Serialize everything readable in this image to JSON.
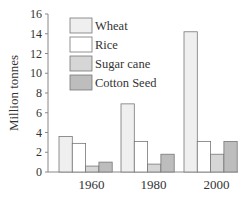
{
  "chart_data": {
    "type": "bar",
    "title": "",
    "xlabel": "",
    "ylabel": "Million tonnes",
    "ylim": [
      0,
      16
    ],
    "yticks": [
      0,
      2,
      4,
      6,
      8,
      10,
      12,
      14,
      16
    ],
    "grid": false,
    "legend_position": "upper-left (inside)",
    "categories": [
      "1960",
      "1980",
      "2000"
    ],
    "series": [
      {
        "name": "Wheat",
        "color": "#efefef",
        "values": [
          3.6,
          6.9,
          14.2
        ]
      },
      {
        "name": "Rice",
        "color": "#ffffff",
        "values": [
          2.9,
          3.1,
          3.1
        ]
      },
      {
        "name": "Sugar cane",
        "color": "#d6d6d6",
        "values": [
          0.6,
          0.8,
          1.8
        ]
      },
      {
        "name": "Cotton Seed",
        "color": "#bdbdbd",
        "values": [
          1.0,
          1.8,
          3.1
        ]
      }
    ]
  },
  "colors": {
    "axis": "#888888",
    "bar_stroke": "#777777",
    "text": "#333333"
  }
}
